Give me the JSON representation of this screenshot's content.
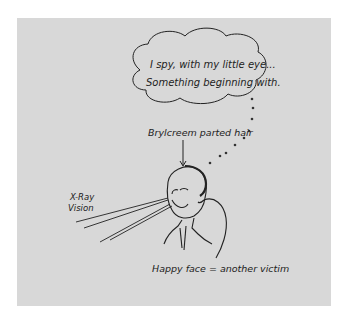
{
  "illustration": {
    "background_color": "#d8d8d8",
    "ink_color": "#222222",
    "thought_bubble": {
      "line1": "I spy, with my little eye...",
      "line2": "Something beginning with."
    },
    "labels": {
      "hair": "Brylcreem parted hair",
      "xray_line1": "X-Ray",
      "xray_line2": "Vision",
      "caption": "Happy face = another victim"
    }
  }
}
